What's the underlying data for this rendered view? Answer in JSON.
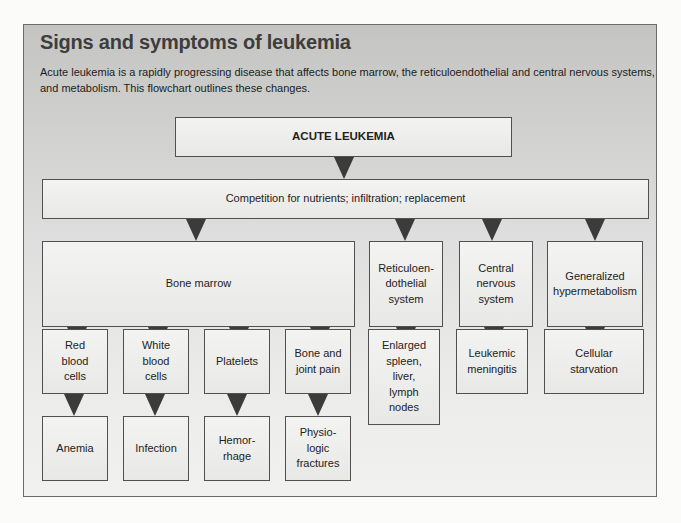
{
  "figure": {
    "title": "Signs and symptoms of leukemia",
    "intro": "Acute leukemia is a rapidly progressing disease that affects bone marrow, the reticuloendothelial and central nervous systems, and metabolism. This flowchart outlines these changes."
  },
  "flowchart": {
    "root": "ACUTE LEUKEMIA",
    "mechanism": "Competition for nutrients; infiltration; replacement",
    "systems": [
      {
        "label": "Bone marrow"
      },
      {
        "label": "Reticuloen-dothelial system"
      },
      {
        "label": "Central nervous system"
      },
      {
        "label": "Generalized hypermetabolism"
      }
    ],
    "bone_marrow_effects": [
      {
        "label": "Red blood cells",
        "outcome": "Anemia"
      },
      {
        "label": "White blood cells",
        "outcome": "Infection"
      },
      {
        "label": "Platelets",
        "outcome": "Hemor-rhage"
      },
      {
        "label": "Bone and joint pain",
        "outcome": "Physio-logic fractures"
      }
    ],
    "system_outcomes": [
      {
        "label": "Enlarged spleen, liver, lymph nodes"
      },
      {
        "label": "Leukemic meningitis"
      },
      {
        "label": "Cellular starvation"
      }
    ]
  },
  "colors": {
    "arrow": "#3b3b3b",
    "border": "#505050",
    "panel_top": "#c4c4c2",
    "panel_bottom": "#f1f1f0"
  }
}
